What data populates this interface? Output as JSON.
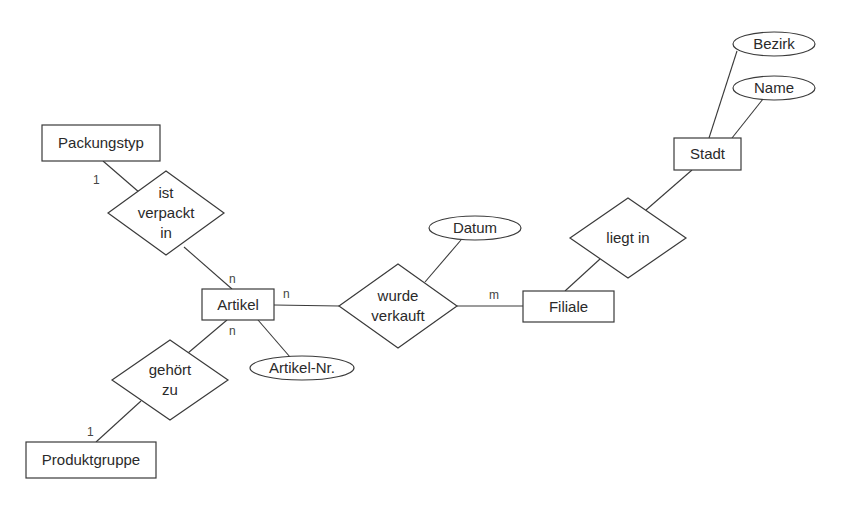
{
  "diagram": {
    "type": "entity-relationship",
    "colors": {
      "stroke": "#3a3a3a",
      "text": "#2a2a2a",
      "background": "#ffffff"
    },
    "entities": [
      {
        "id": "packungstyp",
        "label": "Packungstyp",
        "x": 42,
        "y": 125,
        "w": 118,
        "h": 36
      },
      {
        "id": "artikel",
        "label": "Artikel",
        "x": 202,
        "y": 289,
        "w": 72,
        "h": 31
      },
      {
        "id": "produktgruppe",
        "label": "Produktgruppe",
        "x": 26,
        "y": 442,
        "w": 130,
        "h": 36
      },
      {
        "id": "filiale",
        "label": "Filiale",
        "x": 523,
        "y": 291,
        "w": 91,
        "h": 31
      },
      {
        "id": "stadt",
        "label": "Stadt",
        "x": 674,
        "y": 138,
        "w": 67,
        "h": 32
      }
    ],
    "relationships": [
      {
        "id": "ist-verpackt-in",
        "lines": [
          "ist",
          "verpackt",
          "in"
        ],
        "cx": 166,
        "cy": 213,
        "hw": 58,
        "hh": 42
      },
      {
        "id": "gehoert-zu",
        "lines": [
          "gehört",
          "zu"
        ],
        "cx": 170,
        "cy": 380,
        "hw": 58,
        "hh": 40
      },
      {
        "id": "wurde-verkauft",
        "lines": [
          "wurde",
          "verkauft"
        ],
        "cx": 398,
        "cy": 306,
        "hw": 59,
        "hh": 42
      },
      {
        "id": "liegt-in",
        "lines": [
          "liegt in"
        ],
        "cx": 628,
        "cy": 238,
        "hw": 58,
        "hh": 40
      }
    ],
    "attributes": [
      {
        "id": "datum",
        "label": "Datum",
        "cx": 475,
        "cy": 228,
        "rx": 46,
        "ry": 12
      },
      {
        "id": "artikel-nr",
        "label": "Artikel-Nr.",
        "cx": 302,
        "cy": 368,
        "rx": 52,
        "ry": 12
      },
      {
        "id": "bezirk",
        "label": "Bezirk",
        "cx": 774,
        "cy": 44,
        "rx": 41,
        "ry": 12
      },
      {
        "id": "name",
        "label": "Name",
        "cx": 774,
        "cy": 88,
        "rx": 41,
        "ry": 12
      }
    ],
    "connections": [
      {
        "from": "packungstyp",
        "to": "ist-verpackt-in",
        "x1": 103,
        "y1": 161,
        "x2": 140,
        "y2": 193
      },
      {
        "from": "ist-verpackt-in",
        "to": "artikel",
        "x1": 184,
        "y1": 247,
        "x2": 232,
        "y2": 289
      },
      {
        "from": "artikel",
        "to": "gehoert-zu",
        "x1": 227,
        "y1": 320,
        "x2": 188,
        "y2": 353
      },
      {
        "from": "gehoert-zu",
        "to": "produktgruppe",
        "x1": 141,
        "y1": 401,
        "x2": 96,
        "y2": 442
      },
      {
        "from": "artikel",
        "to": "wurde-verkauft",
        "x1": 274,
        "y1": 305,
        "x2": 339,
        "y2": 306
      },
      {
        "from": "artikel",
        "to": "artikel-nr",
        "x1": 258,
        "y1": 320,
        "x2": 290,
        "y2": 357
      },
      {
        "from": "wurde-verkauft",
        "to": "filiale",
        "x1": 457,
        "y1": 306,
        "x2": 523,
        "y2": 306
      },
      {
        "from": "wurde-verkauft",
        "to": "datum",
        "x1": 425,
        "y1": 282,
        "x2": 461,
        "y2": 240
      },
      {
        "from": "filiale",
        "to": "liegt-in",
        "x1": 565,
        "y1": 291,
        "x2": 600,
        "y2": 259
      },
      {
        "from": "liegt-in",
        "to": "stadt",
        "x1": 646,
        "y1": 210,
        "x2": 692,
        "y2": 170
      },
      {
        "from": "stadt",
        "to": "bezirk",
        "x1": 709,
        "y1": 138,
        "x2": 737,
        "y2": 51
      },
      {
        "from": "stadt",
        "to": "name",
        "x1": 732,
        "y1": 138,
        "x2": 763,
        "y2": 99
      }
    ],
    "cardinalities": [
      {
        "label": "1",
        "x": 93,
        "y": 184
      },
      {
        "label": "n",
        "x": 229,
        "y": 283
      },
      {
        "label": "n",
        "x": 283,
        "y": 298
      },
      {
        "label": "n",
        "x": 229,
        "y": 335
      },
      {
        "label": "1",
        "x": 87,
        "y": 436
      },
      {
        "label": "m",
        "x": 489,
        "y": 299
      }
    ]
  }
}
